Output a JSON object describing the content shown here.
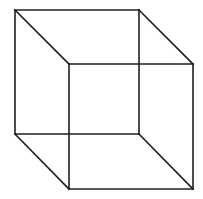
{
  "diagram": {
    "type": "necker-cube-wireframe",
    "background": "#ffffff",
    "stroke_color": "#1f1f1f",
    "stroke_width": 1.6,
    "vertices": {
      "back_top_left": [
        15,
        10
      ],
      "back_top_right": [
        139,
        10
      ],
      "back_bottom_left": [
        15,
        134
      ],
      "back_bottom_right": [
        139,
        134
      ],
      "front_top_left": [
        69,
        64
      ],
      "front_top_right": [
        193,
        64
      ],
      "front_bottom_left": [
        69,
        189
      ],
      "front_bottom_right": [
        193,
        189
      ]
    },
    "edges": [
      {
        "name": "back-top-edge",
        "from": "back_top_left",
        "to": "back_top_right"
      },
      {
        "name": "back-bottom-edge",
        "from": "back_bottom_left",
        "to": "back_bottom_right"
      },
      {
        "name": "back-left-edge",
        "from": "back_top_left",
        "to": "back_bottom_left"
      },
      {
        "name": "back-right-edge",
        "from": "back_top_right",
        "to": "back_bottom_right"
      },
      {
        "name": "front-top-edge",
        "from": "front_top_left",
        "to": "front_top_right"
      },
      {
        "name": "front-bottom-edge",
        "from": "front_bottom_left",
        "to": "front_bottom_right"
      },
      {
        "name": "front-left-edge",
        "from": "front_top_left",
        "to": "front_bottom_left"
      },
      {
        "name": "front-right-edge",
        "from": "front_top_right",
        "to": "front_bottom_right"
      },
      {
        "name": "top-left-connector",
        "from": "back_top_left",
        "to": "front_top_left"
      },
      {
        "name": "top-right-connector",
        "from": "back_top_right",
        "to": "front_top_right"
      },
      {
        "name": "bottom-left-connector",
        "from": "back_bottom_left",
        "to": "front_bottom_left"
      },
      {
        "name": "bottom-right-connector",
        "from": "back_bottom_right",
        "to": "front_bottom_right"
      }
    ]
  }
}
